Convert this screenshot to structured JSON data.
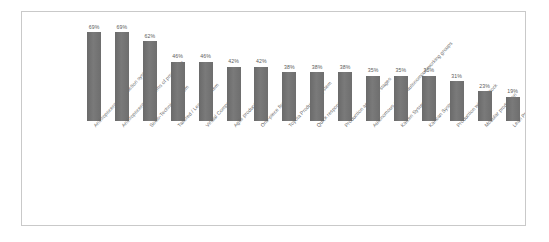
{
  "figure": {
    "border_color": "#c9c9c9",
    "background": "#ffffff",
    "bar_color": "#707070"
  },
  "chart_data": {
    "type": "bar",
    "title": "",
    "subtitle": "",
    "xlabel": "",
    "ylabel": "",
    "ylim": [
      0,
      75
    ],
    "grid": false,
    "legend": "none",
    "orientation": "vertical",
    "value_suffix": "%",
    "categories": [
      "Anthropocentric production system",
      "Anthropocentric systems of production",
      "Socio-Technical System",
      "Tailored / Lean(t) System",
      "Virtual Companies",
      "Agile production",
      "One-piece flow",
      "Toyota Production System",
      "Quick response",
      "Production agents on stages",
      "Autonomous or semi-autonomous working groups",
      "Kaizen System",
      "Kanban System",
      "Production without Stock",
      "Modular production",
      "Lean Production",
      "Just-In-Time (JIT) System"
    ],
    "values": [
      69,
      69,
      62,
      46,
      46,
      42,
      42,
      38,
      38,
      38,
      35,
      35,
      35,
      31,
      23,
      19,
      12
    ],
    "data_labels": [
      "69%",
      "69%",
      "62%",
      "46%",
      "46%",
      "42%",
      "42%",
      "38%",
      "38%",
      "38%",
      "35%",
      "35%",
      "35%",
      "31%",
      "23%",
      "19%",
      "12%"
    ]
  }
}
